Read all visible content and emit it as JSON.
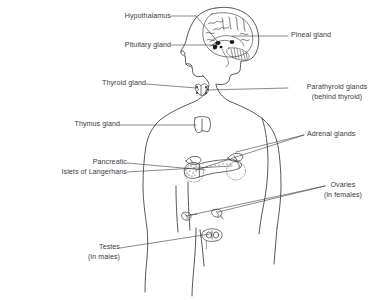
{
  "diagram": {
    "type": "anatomical-line-drawing",
    "background_color": "#ffffff",
    "stroke_color": "#3a3a3a"
  },
  "labels": {
    "hypothalamus": {
      "text": "Hypothalamus",
      "align": "right",
      "x": 168,
      "y": 12
    },
    "pituitary_gland": {
      "text": "Pituitary gland",
      "align": "right",
      "x": 168,
      "y": 41
    },
    "thyroid_gland": {
      "text": "Thyroid gland",
      "align": "right",
      "x": 143,
      "y": 79
    },
    "thymus_gland": {
      "text": "Thymus gland",
      "align": "right",
      "x": 117,
      "y": 120
    },
    "pancreatic_line1": {
      "text": "Pancreatic",
      "x": 38,
      "y": 158
    },
    "pancreatic_line2": {
      "text": "Islets of Langerhans",
      "x": 24,
      "y": 168
    },
    "testes_line1": {
      "text": "Testes",
      "x": 84,
      "y": 243
    },
    "testes_line2": {
      "text": "(in males)",
      "x": 74,
      "y": 253
    },
    "pineal_gland": {
      "text": "Pineal gland",
      "align": "left",
      "x": 291,
      "y": 31
    },
    "parathyroid_line1": {
      "text": "Parathyroid glands",
      "x": 291,
      "y": 83
    },
    "parathyroid_line2": {
      "text": "(behind thyroid)",
      "x": 300,
      "y": 93
    },
    "adrenal_glands": {
      "text": "Adrenal glands",
      "align": "left",
      "x": 307,
      "y": 130
    },
    "ovaries_line1": {
      "text": "Ovaries",
      "x": 328,
      "y": 181
    },
    "ovaries_line2": {
      "text": "(in females)",
      "x": 318,
      "y": 191
    }
  },
  "organs": [
    {
      "name": "brain",
      "label_ref": "hypothalamus"
    },
    {
      "name": "pineal-gland",
      "label_ref": "pineal_gland"
    },
    {
      "name": "pituitary-gland",
      "label_ref": "pituitary_gland"
    },
    {
      "name": "thyroid-gland",
      "label_ref": "thyroid_gland"
    },
    {
      "name": "parathyroid-glands",
      "label_ref": "parathyroid_line1"
    },
    {
      "name": "thymus-gland",
      "label_ref": "thymus_gland"
    },
    {
      "name": "adrenal-glands",
      "label_ref": "adrenal_glands"
    },
    {
      "name": "pancreas-islets",
      "label_ref": "pancreatic_line1"
    },
    {
      "name": "ovaries",
      "label_ref": "ovaries_line1"
    },
    {
      "name": "testes",
      "label_ref": "testes_line1"
    }
  ]
}
